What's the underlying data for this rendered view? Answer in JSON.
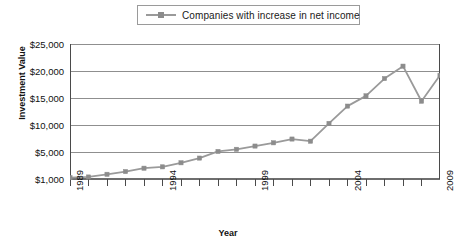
{
  "chart_data": {
    "type": "line",
    "title": "",
    "xlabel": "Year",
    "ylabel": "Investment Value",
    "legend": [
      "Companies with increase in net income"
    ],
    "legend_position": "top-center",
    "grid": true,
    "x": [
      1989,
      1990,
      1991,
      1992,
      1993,
      1994,
      1995,
      1996,
      1997,
      1998,
      1999,
      2000,
      2001,
      2002,
      2003,
      2004,
      2005,
      2006,
      2007,
      2008,
      2009
    ],
    "xtick_labels": [
      "1989",
      "1994",
      "1999",
      "2004",
      "2009"
    ],
    "xtick_values": [
      1989,
      1994,
      1999,
      2004,
      2009
    ],
    "ytick_labels": [
      "$1,000",
      "$5,000",
      "$10,000",
      "$15,000",
      "$20,000",
      "$25,000"
    ],
    "ytick_values": [
      1000,
      5000,
      10000,
      15000,
      20000,
      25000
    ],
    "ylim": [
      1000,
      25000
    ],
    "series": [
      {
        "name": "Companies with increase in net income",
        "color": "#9a9a9a",
        "marker": "square",
        "values": [
          1200,
          1300,
          1700,
          2100,
          2600,
          2800,
          3400,
          4100,
          5100,
          5500,
          6100,
          6700,
          7400,
          7000,
          10300,
          13500,
          15400,
          18600,
          20900,
          14400,
          19200
        ]
      }
    ]
  },
  "legend": {
    "entry_label": "Companies with increase in net income"
  },
  "axes": {
    "y_title": "Investment Value",
    "x_title": "Year"
  }
}
